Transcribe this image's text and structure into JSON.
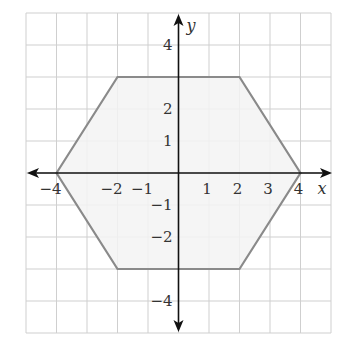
{
  "figure": {
    "colors": {
      "background": "#ffffff",
      "grid": "#cfcfcf",
      "axis": "#111111",
      "polygon_stroke": "#8a8a8a",
      "polygon_fill": "#f3f3f3",
      "label": "#333333"
    },
    "axes": {
      "x_name": "x",
      "y_name": "y",
      "x_range": [
        -5,
        5
      ],
      "y_range": [
        -5,
        5
      ],
      "x_tick_labels": [
        {
          "value": -4,
          "text": "−4"
        },
        {
          "value": -2,
          "text": "−2"
        },
        {
          "value": -1,
          "text": "−1"
        },
        {
          "value": 1,
          "text": "1"
        },
        {
          "value": 2,
          "text": "2"
        },
        {
          "value": 3,
          "text": "3"
        },
        {
          "value": 4,
          "text": "4"
        }
      ],
      "y_tick_labels": [
        {
          "value": 4,
          "text": "4"
        },
        {
          "value": 2,
          "text": "2"
        },
        {
          "value": 1,
          "text": "1"
        },
        {
          "value": -1,
          "text": "−1"
        },
        {
          "value": -2,
          "text": "−2"
        },
        {
          "value": -4,
          "text": "−4"
        }
      ]
    },
    "polygon": {
      "name": "hexagon",
      "vertices": [
        [
          -4,
          0
        ],
        [
          -2,
          3
        ],
        [
          2,
          3
        ],
        [
          4,
          0
        ],
        [
          2,
          -3
        ],
        [
          -2,
          -3
        ]
      ]
    }
  },
  "chart_data": {
    "type": "scatter",
    "title": "",
    "xlabel": "x",
    "ylabel": "y",
    "xlim": [
      -5,
      5
    ],
    "ylim": [
      -5,
      5
    ],
    "grid": true,
    "series": [
      {
        "name": "hexagon",
        "closed": true,
        "x": [
          -4,
          -2,
          2,
          4,
          2,
          -2
        ],
        "y": [
          0,
          3,
          3,
          0,
          -3,
          -3
        ]
      }
    ],
    "x_ticks": [
      -4,
      -2,
      -1,
      1,
      2,
      3,
      4
    ],
    "y_ticks": [
      4,
      2,
      1,
      -1,
      -2,
      -4
    ]
  }
}
